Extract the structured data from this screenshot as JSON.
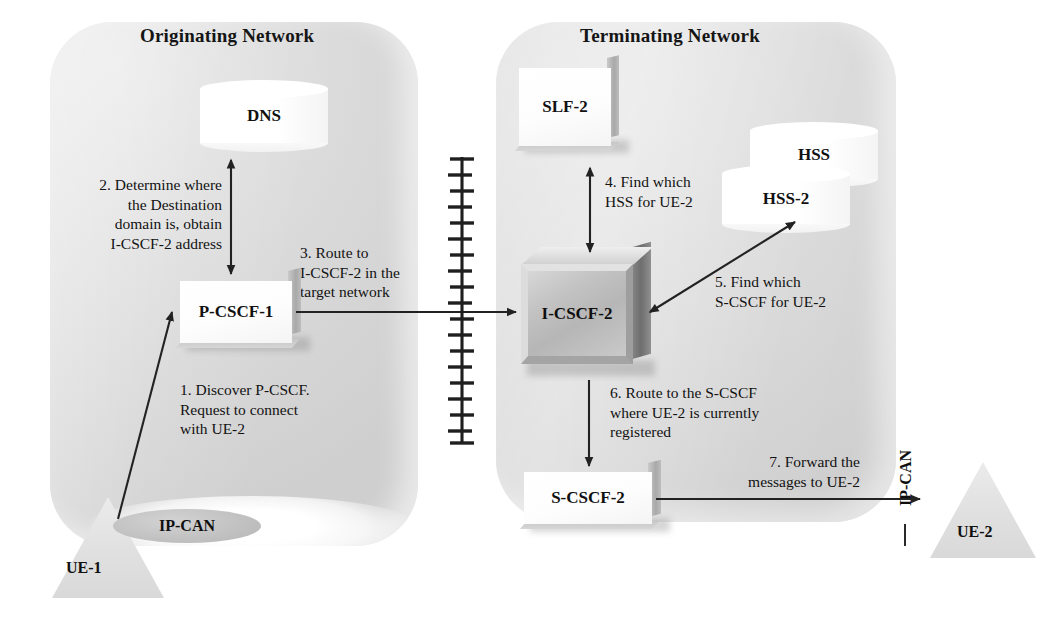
{
  "diagram": {
    "title_originating": "Originating Network",
    "title_terminating": "Terminating Network"
  },
  "nodes": {
    "dns": "DNS",
    "pcscf1": "P-CSCF-1",
    "slf2": "SLF-2",
    "hss": "HSS",
    "hss2": "HSS-2",
    "icscf2": "I-CSCF-2",
    "scscf2": "S-CSCF-2",
    "ue1": "UE-1",
    "ue2": "UE-2",
    "ipcan_left": "IP-CAN",
    "ipcan_right": "IP-CAN"
  },
  "steps": {
    "step1": "1. Discover P-CSCF.\nRequest to connect\nwith UE-2",
    "step2": "2. Determine where\nthe Destination\ndomain is, obtain\nI-CSCF-2 address",
    "step3": "3. Route to\nI-CSCF-2 in the\ntarget network",
    "step4": "4. Find which\nHSS for UE-2",
    "step5": "5. Find which\nS-CSCF for UE-2",
    "step6": "6. Route to the S-CSCF\nwhere UE-2 is currently\nregistered",
    "step7": "7. Forward the\nmessages to UE-2"
  },
  "colors": {
    "panel_fill": "#d8d8d8",
    "box_fill": "#ffffff",
    "icscf_fill": "#bcbcbc",
    "line": "#2a2a2a",
    "text": "#121212",
    "triangle_fill": "#e3e3e3",
    "ellipse_fill": "#c6c6c6"
  }
}
